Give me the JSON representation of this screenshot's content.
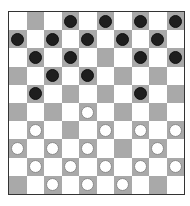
{
  "game": {
    "type": "draughts-10x10",
    "colors": {
      "light_square": "#ffffff",
      "dark_square": "#a9a9a9",
      "black_piece": "#1e1e1e",
      "white_piece": "#ffffff"
    },
    "board": [
      [
        ".",
        "",
        ".",
        "b",
        ".",
        "b",
        ".",
        "b",
        ".",
        "b"
      ],
      [
        "b",
        ".",
        "b",
        ".",
        "b",
        ".",
        "b",
        ".",
        "b",
        "."
      ],
      [
        ".",
        "b",
        ".",
        "b",
        ".",
        "",
        ".",
        "b",
        ".",
        "b"
      ],
      [
        "",
        ".",
        "b",
        ".",
        "b",
        ".",
        "",
        ".",
        "",
        "."
      ],
      [
        ".",
        "b",
        ".",
        "",
        ".",
        "",
        ".",
        "b",
        ".",
        ""
      ],
      [
        "",
        ".",
        "",
        ".",
        "w",
        ".",
        "",
        ".",
        "",
        "."
      ],
      [
        ".",
        "w",
        ".",
        "",
        ".",
        "w",
        ".",
        "w",
        ".",
        "w"
      ],
      [
        "w",
        ".",
        "w",
        ".",
        "w",
        ".",
        "",
        ".",
        "w",
        "."
      ],
      [
        ".",
        "w",
        ".",
        "w",
        ".",
        "w",
        ".",
        "w",
        ".",
        "w"
      ],
      [
        "",
        ".",
        "w",
        ".",
        "w",
        ".",
        "w",
        ".",
        "",
        "."
      ]
    ],
    "legend": {
      ".": "light square",
      "": "empty dark square",
      "b": "black piece",
      "w": "white piece"
    }
  }
}
